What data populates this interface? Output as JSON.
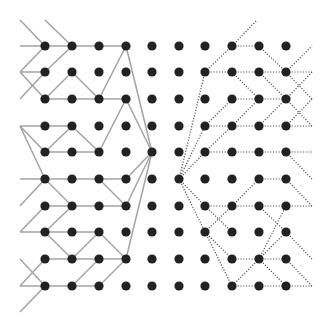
{
  "diagram": {
    "width": 330,
    "height": 331,
    "grid": {
      "columns_x": [
        45,
        72,
        99,
        126,
        152,
        179,
        205,
        232,
        259,
        286
      ],
      "rows_y": [
        46,
        72,
        99,
        126,
        152,
        179,
        206,
        232,
        259,
        286
      ],
      "dot_radius": 4.6,
      "dot_color": "#222222"
    },
    "styles": {
      "solid_color": "#a3a3a3",
      "solid_width": 1.5,
      "dotted_color": "#555555",
      "dotted_width": 1.2
    },
    "left_tree_solid_edges": [
      [
        20,
        20,
        45,
        46
      ],
      [
        45,
        20,
        72,
        46
      ],
      [
        20,
        46,
        45,
        46
      ],
      [
        45,
        46,
        72,
        46
      ],
      [
        72,
        46,
        99,
        46
      ],
      [
        99,
        46,
        126,
        46
      ],
      [
        20,
        72,
        45,
        46
      ],
      [
        20,
        72,
        45,
        72
      ],
      [
        20,
        72,
        45,
        99
      ],
      [
        20,
        99,
        45,
        72
      ],
      [
        45,
        72,
        72,
        46
      ],
      [
        45,
        99,
        72,
        72
      ],
      [
        72,
        72,
        99,
        99
      ],
      [
        45,
        99,
        72,
        99
      ],
      [
        72,
        99,
        99,
        99
      ],
      [
        99,
        99,
        126,
        99
      ],
      [
        99,
        99,
        126,
        46
      ],
      [
        126,
        46,
        152,
        152
      ],
      [
        126,
        99,
        99,
        152
      ],
      [
        126,
        99,
        152,
        152
      ],
      [
        20,
        126,
        45,
        126
      ],
      [
        20,
        126,
        45,
        152
      ],
      [
        20,
        126,
        45,
        179
      ],
      [
        45,
        126,
        72,
        126
      ],
      [
        72,
        126,
        45,
        152
      ],
      [
        72,
        126,
        99,
        152
      ],
      [
        45,
        152,
        72,
        152
      ],
      [
        72,
        152,
        99,
        152
      ],
      [
        20,
        179,
        45,
        179
      ],
      [
        45,
        179,
        72,
        179
      ],
      [
        72,
        179,
        99,
        179
      ],
      [
        99,
        179,
        126,
        179
      ],
      [
        45,
        179,
        20,
        206
      ],
      [
        45,
        179,
        72,
        206
      ],
      [
        99,
        179,
        126,
        206
      ],
      [
        45,
        206,
        72,
        206
      ],
      [
        72,
        206,
        99,
        206
      ],
      [
        99,
        206,
        126,
        206
      ],
      [
        45,
        206,
        20,
        232
      ],
      [
        72,
        206,
        45,
        232
      ],
      [
        20,
        232,
        45,
        232
      ],
      [
        45,
        232,
        72,
        232
      ],
      [
        72,
        232,
        99,
        232
      ],
      [
        45,
        232,
        72,
        259
      ],
      [
        99,
        232,
        126,
        259
      ],
      [
        45,
        259,
        72,
        259
      ],
      [
        72,
        259,
        99,
        259
      ],
      [
        99,
        259,
        126,
        259
      ],
      [
        45,
        259,
        20,
        286
      ],
      [
        20,
        259,
        45,
        286
      ],
      [
        72,
        259,
        99,
        232
      ],
      [
        20,
        286,
        45,
        286
      ],
      [
        45,
        286,
        72,
        286
      ],
      [
        72,
        286,
        99,
        286
      ],
      [
        72,
        286,
        99,
        259
      ],
      [
        99,
        286,
        126,
        259
      ],
      [
        45,
        286,
        20,
        312
      ],
      [
        126,
        179,
        152,
        152
      ],
      [
        126,
        206,
        152,
        152
      ],
      [
        126,
        259,
        152,
        152
      ]
    ],
    "right_tree_dotted_edges": [
      [
        232,
        46,
        257,
        20
      ],
      [
        205,
        72,
        232,
        46
      ],
      [
        232,
        46,
        259,
        46
      ],
      [
        259,
        46,
        286,
        72
      ],
      [
        205,
        72,
        232,
        72
      ],
      [
        232,
        72,
        259,
        72
      ],
      [
        259,
        72,
        286,
        72
      ],
      [
        232,
        72,
        259,
        99
      ],
      [
        259,
        72,
        286,
        99
      ],
      [
        286,
        72,
        312,
        46
      ],
      [
        286,
        72,
        312,
        72
      ],
      [
        286,
        72,
        312,
        99
      ],
      [
        312,
        99,
        286,
        126
      ],
      [
        312,
        72,
        286,
        99
      ],
      [
        286,
        99,
        312,
        126
      ],
      [
        232,
        99,
        259,
        99
      ],
      [
        259,
        99,
        286,
        99
      ],
      [
        205,
        126,
        232,
        99
      ],
      [
        205,
        126,
        232,
        126
      ],
      [
        232,
        126,
        259,
        126
      ],
      [
        259,
        126,
        286,
        126
      ],
      [
        232,
        126,
        259,
        99
      ],
      [
        259,
        126,
        286,
        99
      ],
      [
        286,
        126,
        312,
        126
      ],
      [
        205,
        152,
        232,
        152
      ],
      [
        232,
        152,
        259,
        152
      ],
      [
        259,
        152,
        286,
        152
      ],
      [
        286,
        152,
        312,
        152
      ],
      [
        286,
        152,
        312,
        179
      ],
      [
        205,
        152,
        232,
        126
      ],
      [
        179,
        179,
        205,
        72
      ],
      [
        179,
        179,
        205,
        126
      ],
      [
        179,
        179,
        205,
        152
      ],
      [
        179,
        179,
        205,
        206
      ],
      [
        179,
        179,
        205,
        232
      ],
      [
        259,
        179,
        286,
        179
      ],
      [
        286,
        179,
        312,
        206
      ],
      [
        232,
        206,
        259,
        179
      ],
      [
        205,
        206,
        232,
        206
      ],
      [
        232,
        206,
        259,
        206
      ],
      [
        259,
        206,
        286,
        206
      ],
      [
        286,
        206,
        312,
        206
      ],
      [
        205,
        206,
        232,
        232
      ],
      [
        205,
        232,
        232,
        206
      ],
      [
        259,
        206,
        286,
        232
      ],
      [
        205,
        232,
        232,
        259
      ],
      [
        205,
        232,
        232,
        286
      ],
      [
        232,
        259,
        259,
        259
      ],
      [
        259,
        259,
        286,
        259
      ],
      [
        259,
        259,
        232,
        286
      ],
      [
        259,
        259,
        286,
        286
      ],
      [
        259,
        259,
        286,
        206
      ],
      [
        259,
        259,
        286,
        232
      ],
      [
        286,
        232,
        312,
        259
      ],
      [
        286,
        259,
        312,
        286
      ],
      [
        232,
        286,
        259,
        286
      ],
      [
        259,
        286,
        286,
        286
      ],
      [
        286,
        286,
        312,
        286
      ]
    ]
  }
}
